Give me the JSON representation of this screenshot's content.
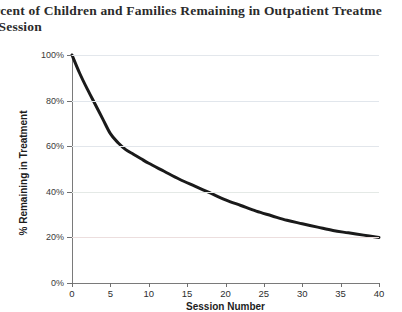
{
  "title": {
    "line1": "ercent of  Children and Families Remaining in Outpatient Treatme",
    "line2": "y Session",
    "full_text": "Percent of Children and Families Remaining in Outpatient Treatment by Session",
    "note_cropped": "left and right edges of the title are cut off by the image border"
  },
  "chart_data": {
    "type": "line",
    "xlabel": "Session Number",
    "ylabel": "% Remaining in Treatment",
    "xlim": [
      0,
      40
    ],
    "ylim": [
      0,
      100
    ],
    "grid": true,
    "legend": null,
    "legend_position": "none",
    "xticks": [
      0,
      5,
      10,
      15,
      20,
      25,
      30,
      35,
      40
    ],
    "xtick_labels": [
      "0",
      "5",
      "10",
      "15",
      "20",
      "25",
      "30",
      "35",
      "40"
    ],
    "yticks": [
      0,
      20,
      40,
      60,
      80,
      100
    ],
    "ytick_labels": [
      "0%",
      "20%",
      "40%",
      "60%",
      "80%",
      "100%"
    ],
    "series": [
      {
        "name": "% Remaining in Treatment",
        "color": "#1a1a1a",
        "line_width": 3,
        "x": [
          0,
          1,
          2,
          3,
          4,
          5,
          6,
          7,
          8,
          9,
          10,
          12,
          14,
          16,
          18,
          20,
          22,
          24,
          26,
          28,
          30,
          32,
          34,
          36,
          38,
          40
        ],
        "values": [
          100,
          92,
          85,
          78.5,
          72,
          65.5,
          61.5,
          58.5,
          56.5,
          54.5,
          52.5,
          49,
          45.5,
          42.5,
          39.5,
          36.5,
          34,
          31.5,
          29.5,
          27.5,
          26,
          24.5,
          23,
          22,
          21,
          20
        ]
      }
    ],
    "annotations": []
  },
  "colors": {
    "series_line": "#1a1a1a",
    "axis": "#7a7a7a",
    "gridline": "#dfe4ea",
    "text": "#2b2b2b",
    "background": "#ffffff"
  }
}
